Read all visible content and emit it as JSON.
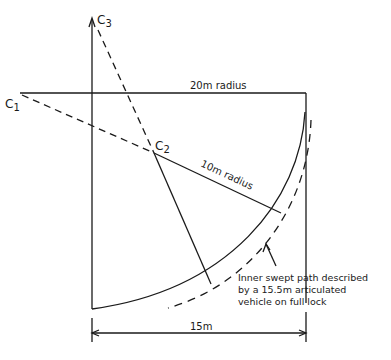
{
  "labels": {
    "c1": "C",
    "c1_sub": "1",
    "c2": "C",
    "c2_sub": "2",
    "c3": "C",
    "c3_sub": "3",
    "radius_20": "20m radius",
    "radius_10": "10m radius",
    "dimension_15": "15m"
  },
  "annotation": {
    "lines": [
      "Inner swept path described",
      "by a 15.5m articulated",
      "vehicle on full lock"
    ]
  },
  "colors": {
    "ink": "#1a1a1a",
    "background": "#ffffff"
  }
}
